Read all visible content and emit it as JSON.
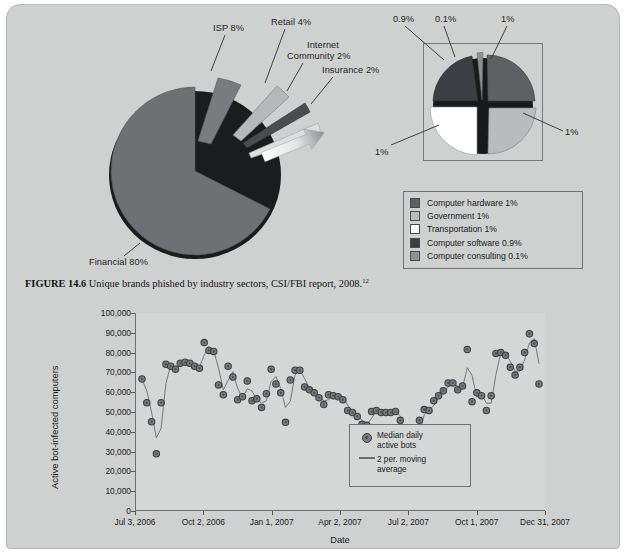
{
  "page": {
    "background_color": "#cfd1d0"
  },
  "figure_pie": {
    "caption_label": "FIGURE 14.6",
    "caption_text": "Unique brands phished by industry sectors, CSI/FBI report, 2008.",
    "caption_superscript": "12",
    "callouts": {
      "isp": "ISP 8%",
      "retail": "Retail 4%",
      "internet_community_line1": "Internet",
      "internet_community_line2": "Community 2%",
      "insurance": "Insurance 2%",
      "financial": "Financial 80%"
    },
    "inset_callouts": {
      "software": "0.9%",
      "consulting": "0.1%",
      "hardware": "1%",
      "government": "1%",
      "transportation": "1%"
    },
    "legend": {
      "items": [
        {
          "label": "Computer hardware 1%",
          "color": "#5d6164"
        },
        {
          "label": "Government 1%",
          "color": "#b9bbbd"
        },
        {
          "label": "Transportation 1%",
          "color": "#ffffff"
        },
        {
          "label": "Computer software 0.9%",
          "color": "#3b3f43"
        },
        {
          "label": "Computer consulting 0.1%",
          "color": "#8f9295"
        }
      ]
    },
    "chart_data": {
      "type": "pie",
      "title": "Unique brands phished by industry sectors, CSI/FBI report, 2008",
      "labels": [
        "Financial",
        "ISP",
        "Retail",
        "Internet Community",
        "Insurance",
        "Computer hardware",
        "Government",
        "Transportation",
        "Computer software",
        "Computer consulting"
      ],
      "values": [
        80,
        8,
        4,
        2,
        2,
        1,
        1,
        1,
        0.9,
        0.1
      ],
      "value_labels": [
        "80%",
        "8%",
        "4%",
        "2%",
        "2%",
        "1%",
        "1%",
        "1%",
        "0.9%",
        "0.1%"
      ],
      "colors": [
        "#6e7174",
        "#797c7f",
        "#b6b8ba",
        "#4a4d50",
        "#dcdedf",
        "#5d6164",
        "#b9bbbd",
        "#ffffff",
        "#3b3f43",
        "#8f9295"
      ],
      "exploded": true,
      "inset_group": [
        "Computer hardware",
        "Government",
        "Transportation",
        "Computer software",
        "Computer consulting"
      ],
      "legend_position": "bottom-right"
    }
  },
  "figure_scatter": {
    "chart_data": {
      "type": "scatter",
      "title": "",
      "xlabel": "Date",
      "ylabel": "Active bot-infected computers",
      "ylim": [
        0,
        100000
      ],
      "ytick_labels": [
        "0",
        "10,000",
        "20,000",
        "30,000",
        "40,000",
        "50,000",
        "60,000",
        "70,000",
        "80,000",
        "90,000",
        "100,000"
      ],
      "ytick_values": [
        0,
        10000,
        20000,
        30000,
        40000,
        50000,
        60000,
        70000,
        80000,
        90000,
        100000
      ],
      "xtick_labels": [
        "Jul 3, 2006",
        "Oct 2, 2006",
        "Jan 1, 2007",
        "Apr 2, 2007",
        "Jul 2, 2007",
        "Oct 1, 2007",
        "Dec 31, 2007"
      ],
      "grid": false,
      "legend_position": "inside-bottom-right",
      "series": [
        {
          "name": "Median daily active bots",
          "type": "scatter",
          "marker": "circle",
          "color": "#797d80",
          "values": [
            66500,
            54500,
            44800,
            28500,
            54500,
            74000,
            73000,
            71500,
            74500,
            75000,
            74500,
            73000,
            72000,
            85000,
            81000,
            80500,
            63500,
            58500,
            73000,
            67500,
            56000,
            57500,
            65500,
            55500,
            56500,
            52000,
            59000,
            71500,
            64000,
            59500,
            44500,
            66000,
            71000,
            71000,
            62500,
            61000,
            59500,
            57000,
            53500,
            58500,
            58000,
            57500,
            56000,
            50500,
            49500,
            47500,
            43500,
            43000,
            50000,
            50500,
            49500,
            49500,
            49500,
            50000,
            45500,
            29500,
            25000,
            33000,
            45500,
            51000,
            50500,
            55500,
            58000,
            60500,
            64500,
            64500,
            61000,
            63000,
            81500,
            55000,
            59500,
            58000,
            50500,
            58000,
            79500,
            80000,
            78500,
            72500,
            68500,
            72500,
            80000,
            89500,
            84500,
            64000
          ]
        },
        {
          "name": "2 per. moving average",
          "type": "line",
          "color": "#6a6d70"
        }
      ]
    },
    "legend": {
      "items": [
        {
          "label_line1": "Median daily",
          "label_line2": "active bots",
          "marker": "circle"
        },
        {
          "label_line1": "2 per. moving",
          "label_line2": "average",
          "marker": "line"
        }
      ]
    }
  }
}
